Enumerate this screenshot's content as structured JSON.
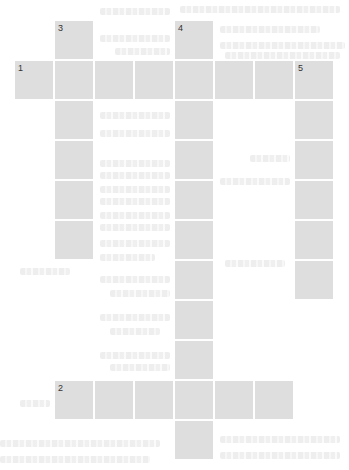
{
  "puzzle": {
    "type": "crossword",
    "cell_color": "#dedede",
    "number_color": "#333333",
    "grid": {
      "origin_x": 15,
      "origin_y": 21,
      "pitch": 40,
      "cell_size": 38,
      "cols": 8,
      "rows": 11
    },
    "entries": [
      {
        "number": "1",
        "direction": "across",
        "row": 1,
        "col": 0,
        "length": 8
      },
      {
        "number": "2",
        "direction": "across",
        "row": 9,
        "col": 1,
        "length": 6
      },
      {
        "number": "3",
        "direction": "down",
        "row": 0,
        "col": 1,
        "length": 6
      },
      {
        "number": "4",
        "direction": "down",
        "row": 0,
        "col": 4,
        "length": 11
      },
      {
        "number": "5",
        "direction": "down",
        "row": 1,
        "col": 7,
        "length": 6
      }
    ]
  }
}
